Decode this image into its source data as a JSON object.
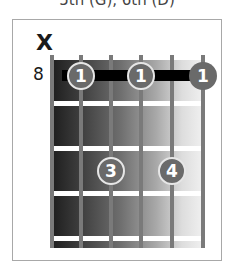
{
  "caption": "5th (G), 6th (D)",
  "diagram": {
    "muted_marker": "X",
    "start_fret": "8",
    "strings": 6,
    "frets_shown": 4,
    "barre": {
      "finger": "1",
      "fret": 1,
      "from_string": 2,
      "to_string": 6
    },
    "fingers": [
      {
        "finger": "1",
        "string": 2,
        "fret": 1
      },
      {
        "finger": "1",
        "string": 4,
        "fret": 1
      },
      {
        "finger": "1",
        "string": 6,
        "fret": 1
      },
      {
        "finger": "3",
        "string": 3,
        "fret": 3
      },
      {
        "finger": "4",
        "string": 5,
        "fret": 3
      }
    ]
  }
}
